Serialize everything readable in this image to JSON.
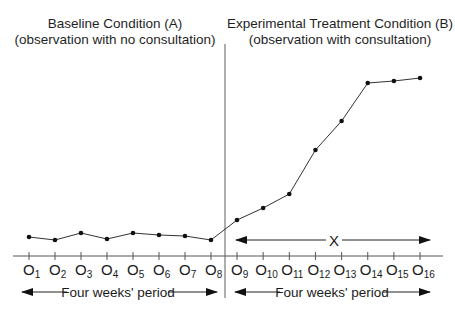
{
  "headings": {
    "baseline": {
      "title": "Baseline Condition (A)",
      "subtitle": "(observation with no consultation)"
    },
    "treatment": {
      "title": "Experimental Treatment Condition (B)",
      "subtitle": "(observation with consultation)"
    }
  },
  "period_labels": {
    "left": "Four weeks' period",
    "right": "Four weeks' period"
  },
  "treatment_span_label": "X",
  "observation_prefix": "O",
  "colors": {
    "line": "#333333",
    "point": "#111111",
    "axis": "#555555",
    "divider": "#777777"
  },
  "chart_data": {
    "type": "line",
    "title": "",
    "xlabel": "",
    "ylabel": "",
    "grid": false,
    "legend": "none",
    "categories": [
      "O1",
      "O2",
      "O3",
      "O4",
      "O5",
      "O6",
      "O7",
      "O8",
      "O9",
      "O10",
      "O11",
      "O12",
      "O13",
      "O14",
      "O15",
      "O16"
    ],
    "phases": [
      {
        "name": "Baseline Condition (A)",
        "description": "observation with no consultation",
        "range": [
          "O1",
          "O8"
        ],
        "duration": "Four weeks' period"
      },
      {
        "name": "Experimental Treatment Condition (B)",
        "description": "observation with consultation",
        "range": [
          "O9",
          "O16"
        ],
        "duration": "Four weeks' period",
        "treatment": "X"
      }
    ],
    "series": [
      {
        "name": "Observations",
        "values": [
          19,
          16,
          23,
          17,
          23,
          21,
          20,
          16,
          36,
          48,
          62,
          106,
          135,
          173,
          175,
          178
        ]
      }
    ],
    "ylim": [
      0,
      200
    ],
    "annotations": [
      "Vertical divider between O8 and O9 separating phase A and phase B",
      "Double-headed arrow labeled X spanning O9–O16"
    ]
  }
}
